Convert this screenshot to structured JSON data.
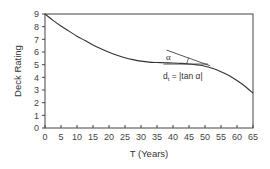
{
  "chart_data": {
    "type": "line",
    "title": "",
    "xlabel": "T (Years)",
    "ylabel": "Deck Rating",
    "xlim": [
      0,
      65
    ],
    "ylim": [
      0,
      9
    ],
    "xticks": [
      0,
      5,
      10,
      15,
      20,
      25,
      30,
      35,
      40,
      45,
      50,
      55,
      60,
      65
    ],
    "yticks": [
      0,
      1,
      2,
      3,
      4,
      5,
      6,
      7,
      8,
      9
    ],
    "grid": false,
    "legend": null,
    "series": [
      {
        "name": "Deck rating deterioration curve",
        "x": [
          0,
          2.5,
          5,
          7.5,
          10,
          12.5,
          15,
          17.5,
          20,
          22.5,
          25,
          27.5,
          30,
          32.5,
          35,
          37.5,
          40,
          42.5,
          45,
          47.5,
          50,
          52.5,
          55,
          57.5,
          60,
          62.5,
          65
        ],
        "values": [
          9.0,
          8.5,
          8.05,
          7.65,
          7.25,
          6.9,
          6.55,
          6.25,
          5.98,
          5.75,
          5.55,
          5.4,
          5.28,
          5.2,
          5.17,
          5.15,
          5.13,
          5.1,
          5.05,
          4.98,
          4.88,
          4.7,
          4.45,
          4.15,
          3.75,
          3.3,
          2.75
        ]
      }
    ],
    "annotations": [
      {
        "type": "tangent-line",
        "at_x": 51,
        "note": "tangent to curve"
      },
      {
        "type": "horizontal-reference",
        "from_x": 37,
        "to_x": 51,
        "y": 5.05
      },
      {
        "type": "angle-arc",
        "label": "α",
        "x": 41,
        "y": 5.6
      },
      {
        "type": "text",
        "label": "d_t = |tan α|",
        "x": 40,
        "y": 3.7
      }
    ]
  },
  "labels": {
    "ylabel": "Deck Rating",
    "xlabel": "T (Years)",
    "alpha": "α",
    "formula_d": "d",
    "formula_sub": "t",
    "formula_rest": " = |tan α|"
  }
}
